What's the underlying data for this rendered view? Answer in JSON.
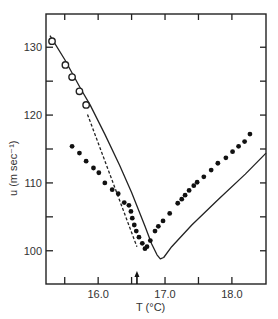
{
  "chart_data": {
    "type": "scatter",
    "title": "",
    "xlabel": "T (°C)",
    "ylabel": "u (m sec⁻¹)",
    "xlim": [
      15.22,
      18.51
    ],
    "ylim": [
      95.1,
      134.9
    ],
    "grid": false,
    "legend": null,
    "x_ticks": [
      {
        "value": 15.5,
        "label": ""
      },
      {
        "value": 16.0,
        "label": "16.0"
      },
      {
        "value": 16.5,
        "label": ""
      },
      {
        "value": 17.0,
        "label": "17.0"
      },
      {
        "value": 17.5,
        "label": ""
      },
      {
        "value": 18.0,
        "label": "18.0"
      }
    ],
    "y_ticks": [
      {
        "value": 100,
        "label": "100"
      },
      {
        "value": 105,
        "label": ""
      },
      {
        "value": 110,
        "label": "110"
      },
      {
        "value": 115,
        "label": ""
      },
      {
        "value": 120,
        "label": "120"
      },
      {
        "value": 125,
        "label": ""
      },
      {
        "value": 130,
        "label": "130"
      }
    ],
    "annotations": [
      {
        "type": "arrow-up",
        "x": 16.58,
        "note": "marker on T axis"
      }
    ],
    "series": [
      {
        "name": "open-circles",
        "marker": "open-circle",
        "x": [
          15.31,
          15.51,
          15.61,
          15.72,
          15.82
        ],
        "y": [
          130.9,
          127.4,
          125.6,
          123.5,
          121.5
        ]
      },
      {
        "name": "filled-dots",
        "marker": "filled-circle",
        "x": [
          15.61,
          15.72,
          15.82,
          15.93,
          16.01,
          16.1,
          16.21,
          16.3,
          16.39,
          16.46,
          16.49,
          16.51,
          16.54,
          16.57,
          16.61,
          16.66,
          16.7,
          16.73,
          16.78,
          16.85,
          16.9,
          16.97,
          17.07,
          17.19,
          17.25,
          17.3,
          17.36,
          17.43,
          17.48,
          17.58,
          17.69,
          17.79,
          17.91,
          18.01,
          18.1,
          18.19,
          18.27
        ],
        "y": [
          115.4,
          114.4,
          113.2,
          112.2,
          111.5,
          110.0,
          109.0,
          108.4,
          107.1,
          106.7,
          105.8,
          104.8,
          103.8,
          102.9,
          102.0,
          101.1,
          100.3,
          100.6,
          101.5,
          102.9,
          103.6,
          104.4,
          105.5,
          107.0,
          107.6,
          108.2,
          108.9,
          109.6,
          110.1,
          110.9,
          111.9,
          112.9,
          113.7,
          114.6,
          115.4,
          116.1,
          117.2
        ]
      },
      {
        "name": "solid-curve",
        "line": "solid",
        "x": [
          15.28,
          15.5,
          15.75,
          15.88,
          16.1,
          16.32,
          16.5,
          16.7,
          16.8,
          16.88,
          16.93,
          16.98,
          17.1,
          17.4,
          17.8,
          18.2,
          18.51
        ],
        "y": [
          131.7,
          128.2,
          123.7,
          121.5,
          117.2,
          112.6,
          108.6,
          103.6,
          101.0,
          99.4,
          98.8,
          99.0,
          100.6,
          103.8,
          107.6,
          111.3,
          114.4
        ]
      },
      {
        "name": "dashed-line",
        "line": "dashed",
        "x": [
          15.84,
          16.58
        ],
        "y": [
          120.1,
          100.6
        ]
      }
    ]
  }
}
